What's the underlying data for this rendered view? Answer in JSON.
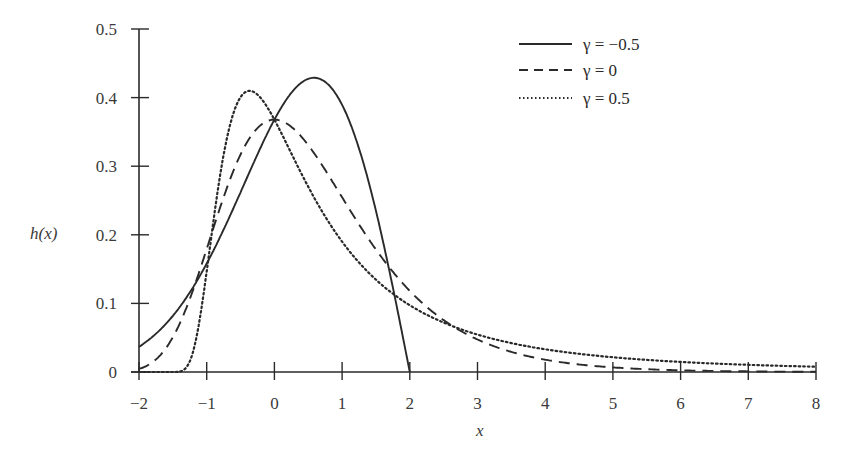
{
  "chart_data": {
    "type": "line",
    "title": "",
    "xlabel": "x",
    "ylabel": "h(x)",
    "xlim": [
      -2,
      8
    ],
    "ylim": [
      0,
      0.5
    ],
    "x_ticks": [
      "−2",
      "−1",
      "0",
      "1",
      "2",
      "3",
      "4",
      "5",
      "6",
      "7",
      "8"
    ],
    "y_ticks": [
      "0",
      "0.1",
      "0.2",
      "0.3",
      "0.4",
      "0.5"
    ],
    "grid": false,
    "legend_position": "upper right",
    "series": [
      {
        "name": "γ = −0.5",
        "style": "solid",
        "x": [
          -2,
          -1.5,
          -1,
          -0.5,
          0,
          0.3,
          0.6,
          0.9,
          1.2,
          1.5,
          1.7,
          1.85,
          2
        ],
        "values": [
          0.037,
          0.086,
          0.158,
          0.249,
          0.368,
          0.412,
          0.429,
          0.413,
          0.363,
          0.273,
          0.187,
          0.105,
          0
        ]
      },
      {
        "name": "γ = 0",
        "style": "dashed",
        "x": [
          -2,
          -1.5,
          -1,
          -0.5,
          0,
          0.5,
          1,
          1.5,
          2,
          3,
          4,
          5,
          6,
          7,
          8
        ],
        "values": [
          0.005,
          0.051,
          0.179,
          0.317,
          0.368,
          0.331,
          0.254,
          0.179,
          0.118,
          0.047,
          0.018,
          0.007,
          0.002,
          0.001,
          0.0003
        ]
      },
      {
        "name": "γ = 0.5",
        "style": "dotted",
        "x": [
          -2,
          -1.5,
          -1.2,
          -1,
          -0.8,
          -0.6,
          -0.4,
          -0.2,
          0,
          0.5,
          1,
          2,
          3,
          4,
          5,
          6,
          7,
          8
        ],
        "values": [
          0,
          0,
          0.058,
          0.164,
          0.299,
          0.384,
          0.409,
          0.394,
          0.368,
          0.282,
          0.211,
          0.125,
          0.077,
          0.05,
          0.034,
          0.024,
          0.017,
          0.013
        ]
      }
    ]
  },
  "legend": {
    "items": [
      {
        "label": "γ = −0.5",
        "style": "solid"
      },
      {
        "label": "γ = 0",
        "style": "dashed"
      },
      {
        "label": "γ = 0.5",
        "style": "dotted"
      }
    ]
  },
  "axes": {
    "xlabel": "x",
    "ylabel": "h(x)"
  }
}
